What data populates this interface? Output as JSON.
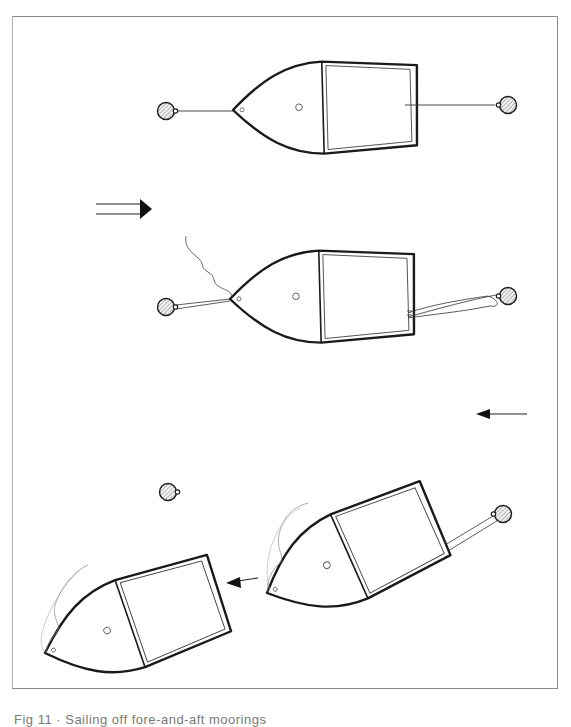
{
  "figure": {
    "caption": "Fig 11 · Sailing off fore-and-aft moorings",
    "caption_visible": "partial (clipped at bottom edge)",
    "colors": {
      "outline": "#1a1a1a",
      "frame": "#8a8a8a",
      "buoy_hatch": "#9a9a9a",
      "thin_line": "#555555"
    },
    "panels": [
      {
        "id": "stage-1",
        "description": "Boat moored fore-and-aft between two buoys, bow to the left"
      },
      {
        "id": "stage-2",
        "description": "Bow line slipped to a doubled line, sail raised, stern line doubled back"
      },
      {
        "id": "stage-3",
        "description": "Boat released from stern buoy, drifting and sailing away to the left"
      }
    ],
    "indicators": [
      {
        "id": "tide-arrow",
        "type": "double-shaft arrow",
        "direction": "right"
      },
      {
        "id": "wind-arrow",
        "type": "arrow",
        "direction": "left"
      },
      {
        "id": "motion-arrow",
        "type": "arrow",
        "direction": "left"
      }
    ]
  }
}
